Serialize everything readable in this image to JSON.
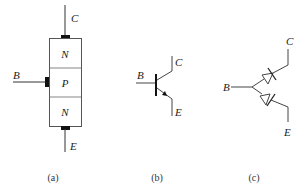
{
  "panels": [
    {
      "id": "a",
      "caption": "(a)",
      "terminals": {
        "collector": "C",
        "base": "B",
        "emitter": "E"
      },
      "layers": [
        "N",
        "P",
        "N"
      ]
    },
    {
      "id": "b",
      "caption": "(b)",
      "terminals": {
        "collector": "C",
        "base": "B",
        "emitter": "E"
      },
      "symbol": "npn-transistor"
    },
    {
      "id": "c",
      "caption": "(c)",
      "terminals": {
        "collector": "C",
        "base": "B",
        "emitter": "E"
      },
      "symbol": "two-diode-equivalent"
    }
  ],
  "colors": {
    "stroke": "#333333",
    "contact": "#111111",
    "box_stroke": "#555555"
  }
}
